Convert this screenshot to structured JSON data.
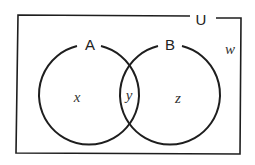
{
  "diagram": {
    "type": "venn",
    "universe": {
      "label": "U"
    },
    "sets": [
      {
        "label": "A"
      },
      {
        "label": "B"
      }
    ],
    "regions": {
      "only_a": "x",
      "a_and_b": "y",
      "only_b": "z",
      "outside": "w"
    },
    "colors": {
      "stroke": "#1e1e1e",
      "background": "#ffffff"
    }
  }
}
